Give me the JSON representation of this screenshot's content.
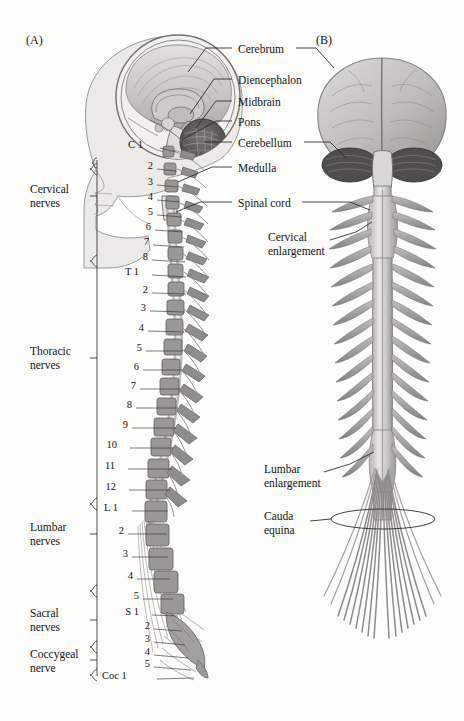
{
  "figure": {
    "background_color": "#fdfdfb",
    "ink_color": "#141414"
  },
  "panels": [
    {
      "id": "A",
      "tag": "(A)",
      "x": 26,
      "y": 40,
      "description": "Lateral midsagittal view of head and vertebral column with segmental spinal nerves"
    },
    {
      "id": "B",
      "tag": "(B)",
      "x": 316,
      "y": 40,
      "description": "Posterior view of brain, spinal cord and cauda equina"
    }
  ],
  "brain_labels": [
    {
      "name": "cerebrum",
      "text": "Cerebrum",
      "x": 238,
      "y": 51,
      "leader_left": true,
      "leader_right": true
    },
    {
      "name": "diencephalon",
      "text": "Diencephalon",
      "x": 238,
      "y": 82,
      "leader_left": true,
      "leader_right": false
    },
    {
      "name": "midbrain",
      "text": "Midbrain",
      "x": 238,
      "y": 104,
      "leader_left": true,
      "leader_right": false
    },
    {
      "name": "pons",
      "text": "Pons",
      "x": 238,
      "y": 124,
      "leader_left": true,
      "leader_right": false
    },
    {
      "name": "cerebellum",
      "text": "Cerebellum",
      "x": 238,
      "y": 145,
      "leader_left": true,
      "leader_right": true
    },
    {
      "name": "medulla",
      "text": "Medulla",
      "x": 238,
      "y": 170,
      "leader_left": true,
      "leader_right": false
    },
    {
      "name": "spinal-cord",
      "text": "Spinal cord",
      "x": 238,
      "y": 205,
      "leader_left": true,
      "leader_right": true
    }
  ],
  "panel_b_labels": [
    {
      "name": "cervical-enlargement",
      "lines": [
        "Cervical",
        "enlargement"
      ],
      "x": 268,
      "y": 238
    },
    {
      "name": "lumbar-enlargement",
      "lines": [
        "Lumbar",
        "enlargement"
      ],
      "x": 264,
      "y": 470
    },
    {
      "name": "cauda-equina",
      "lines": [
        "Cauda",
        "equina"
      ],
      "x": 264,
      "y": 517
    }
  ],
  "nerve_groups": [
    {
      "name": "cervical-nerves",
      "lines": [
        "Cervical",
        "nerves"
      ],
      "x": 30,
      "y": 190,
      "bracket_top": 163,
      "bracket_bottom": 262
    },
    {
      "name": "thoracic-nerves",
      "lines": [
        "Thoracic",
        "nerves"
      ],
      "x": 30,
      "y": 352,
      "bracket_top": 262,
      "bracket_bottom": 505
    },
    {
      "name": "lumbar-nerves",
      "lines": [
        "Lumbar",
        "nerves"
      ],
      "x": 30,
      "y": 528,
      "bracket_top": 505,
      "bracket_bottom": 592
    },
    {
      "name": "sacral-nerves",
      "lines": [
        "Sacral",
        "nerves"
      ],
      "x": 30,
      "y": 614,
      "bracket_top": 592,
      "bracket_bottom": 648
    },
    {
      "name": "coccygeal-nerve",
      "lines": [
        "Coccygeal",
        "nerve"
      ],
      "x": 30,
      "y": 655,
      "bracket_top": 648,
      "bracket_bottom": 676
    }
  ],
  "segment_labels": [
    {
      "id": "C1",
      "text": "C 1",
      "x": 141,
      "y": 147,
      "tx": 172,
      "ty": 152
    },
    {
      "id": "C2",
      "text": "2",
      "x": 151,
      "y": 168,
      "tx": 174,
      "ty": 170
    },
    {
      "id": "C3",
      "text": "3",
      "x": 151,
      "y": 184,
      "tx": 176,
      "ty": 186
    },
    {
      "id": "C4",
      "text": "4",
      "x": 151,
      "y": 199,
      "tx": 178,
      "ty": 201
    },
    {
      "id": "C5",
      "text": "5",
      "x": 151,
      "y": 214,
      "tx": 180,
      "ty": 216
    },
    {
      "id": "C6",
      "text": "6",
      "x": 149,
      "y": 229,
      "tx": 181,
      "ty": 231
    },
    {
      "id": "C7",
      "text": "7",
      "x": 147,
      "y": 244,
      "tx": 182,
      "ty": 246
    },
    {
      "id": "C8",
      "text": "8",
      "x": 146,
      "y": 259,
      "tx": 183,
      "ty": 261
    },
    {
      "id": "T1",
      "text": "T 1",
      "x": 137,
      "y": 274,
      "tx": 184,
      "ty": 276
    },
    {
      "id": "T2",
      "text": "2",
      "x": 146,
      "y": 292,
      "tx": 184,
      "ty": 293
    },
    {
      "id": "T3",
      "text": "3",
      "x": 144,
      "y": 310,
      "tx": 183,
      "ty": 311
    },
    {
      "id": "T4",
      "text": "4",
      "x": 142,
      "y": 330,
      "tx": 182,
      "ty": 331
    },
    {
      "id": "T5",
      "text": "5",
      "x": 140,
      "y": 350,
      "tx": 181,
      "ty": 350
    },
    {
      "id": "T6",
      "text": "6",
      "x": 137,
      "y": 369,
      "tx": 180,
      "ty": 369
    },
    {
      "id": "T7",
      "text": "7",
      "x": 134,
      "y": 388,
      "tx": 178,
      "ty": 388
    },
    {
      "id": "T8",
      "text": "8",
      "x": 130,
      "y": 407,
      "tx": 176,
      "ty": 407
    },
    {
      "id": "T9",
      "text": "9",
      "x": 126,
      "y": 427,
      "tx": 174,
      "ty": 427
    },
    {
      "id": "T10",
      "text": "10",
      "x": 115,
      "y": 447,
      "tx": 172,
      "ty": 447
    },
    {
      "id": "T11",
      "text": "11",
      "x": 113,
      "y": 468,
      "tx": 170,
      "ty": 468
    },
    {
      "id": "T12",
      "text": "12",
      "x": 114,
      "y": 489,
      "tx": 168,
      "ty": 489
    },
    {
      "id": "L1",
      "text": "L 1",
      "x": 116,
      "y": 510,
      "tx": 166,
      "ty": 510
    },
    {
      "id": "L2",
      "text": "2",
      "x": 122,
      "y": 533,
      "tx": 165,
      "ty": 533
    },
    {
      "id": "L3",
      "text": "3",
      "x": 126,
      "y": 556,
      "tx": 166,
      "ty": 556
    },
    {
      "id": "L4",
      "text": "4",
      "x": 131,
      "y": 578,
      "tx": 168,
      "ty": 578
    },
    {
      "id": "L5",
      "text": "5",
      "x": 137,
      "y": 598,
      "tx": 171,
      "ty": 598
    },
    {
      "id": "S1",
      "text": "S 1",
      "x": 137,
      "y": 614,
      "tx": 176,
      "ty": 614
    },
    {
      "id": "S2",
      "text": "2",
      "x": 148,
      "y": 628,
      "tx": 180,
      "ty": 628
    },
    {
      "id": "S3",
      "text": "3",
      "x": 148,
      "y": 641,
      "tx": 183,
      "ty": 641
    },
    {
      "id": "S4",
      "text": "4",
      "x": 148,
      "y": 654,
      "tx": 186,
      "ty": 654
    },
    {
      "id": "S5",
      "text": "5",
      "x": 148,
      "y": 666,
      "tx": 189,
      "ty": 666
    },
    {
      "id": "Coc1",
      "text": "Coc 1",
      "x": 124,
      "y": 678,
      "tx": 192,
      "ty": 678
    }
  ],
  "palette": {
    "skin": "#eceae6",
    "skin_outline": "#8d8d8d",
    "brain_light": "#d8d6d2",
    "brain_mid": "#b9b7b3",
    "brain_dark": "#8e8c88",
    "cerebellum": "#5d5b58",
    "vertebra": "#9a9894",
    "vertebra_outline": "#6e6c68",
    "cord": "#cfcdc9",
    "nerve": "#b3b1ad",
    "nerve_dark": "#7d7b77",
    "leader": "#2a2a2a"
  }
}
